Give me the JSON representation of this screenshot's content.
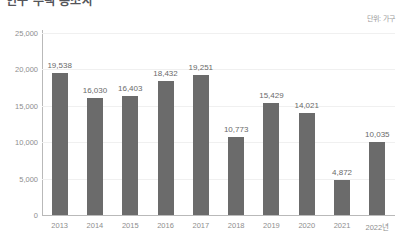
{
  "title": "인구 주택 총조사",
  "unit_note": "단위: 가구",
  "chart_data": {
    "type": "bar",
    "title": "인구 주택 총조사",
    "xlabel": "",
    "ylabel": "",
    "unit": "단위: 가구",
    "categories": [
      "2013",
      "2014",
      "2015",
      "2016",
      "2017",
      "2018",
      "2019",
      "2020",
      "2021",
      "2022년"
    ],
    "values": [
      19538,
      16030,
      16403,
      18432,
      19251,
      10773,
      15429,
      14021,
      4872,
      10035
    ],
    "value_labels": [
      "19,538",
      "16,030",
      "16,403",
      "18,432",
      "19,251",
      "10,773",
      "15,429",
      "14,021",
      "4,872",
      "10,035"
    ],
    "ylim": [
      0,
      25000
    ],
    "yticks": [
      0,
      5000,
      10000,
      15000,
      20000,
      25000
    ],
    "ytick_labels": [
      "0",
      "5,000",
      "10,000",
      "15,000",
      "20,000",
      "25,000"
    ],
    "grid": true,
    "legend": false,
    "bar_color": "#6b6b6b",
    "axis_color": "#b9b9b9",
    "grid_color": "#f0f0f0"
  }
}
